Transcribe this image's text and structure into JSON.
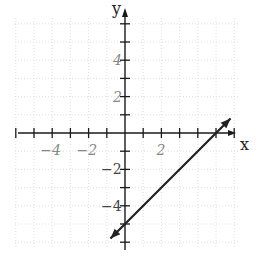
{
  "chart_data": {
    "type": "line",
    "title": "",
    "xlabel": "x",
    "ylabel": "y",
    "xlim": [
      -6.5,
      6
    ],
    "ylim": [
      -6.5,
      6.5
    ],
    "grid": true,
    "x_ticks": [
      -6,
      -5,
      -4,
      -3,
      -2,
      -1,
      1,
      2,
      3,
      4,
      5,
      6
    ],
    "y_ticks": [
      -6,
      -5,
      -4,
      -3,
      -2,
      -1,
      1,
      2,
      3,
      4,
      5,
      6
    ],
    "x_tick_labels": [
      {
        "value": -4,
        "label": "−4"
      },
      {
        "value": -2,
        "label": "−2"
      },
      {
        "value": 2,
        "label": "2"
      }
    ],
    "y_tick_labels": [
      {
        "value": 4,
        "label": "4"
      },
      {
        "value": 2,
        "label": "2"
      },
      {
        "value": -2,
        "label": "−2"
      },
      {
        "value": -4,
        "label": "−4"
      }
    ],
    "series": [
      {
        "name": "y = x − 5",
        "equation": "y = x - 5",
        "slope": 1,
        "intercept": -5,
        "x": [
          -0.8,
          5.8
        ],
        "y": [
          -5.8,
          0.8
        ],
        "arrows": "both",
        "color": "#222222"
      }
    ],
    "colors": {
      "axes": "#1a1a1a",
      "grid": "#d8d8d8",
      "line": "#222222"
    }
  }
}
